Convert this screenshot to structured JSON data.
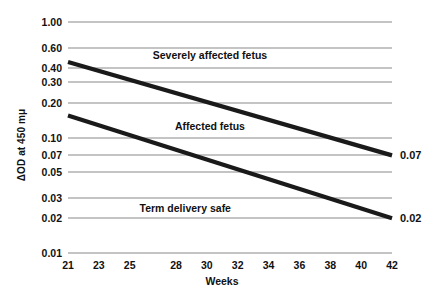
{
  "chart_data": {
    "type": "line",
    "title": "",
    "xlabel": "Weeks",
    "ylabel": "ΔOD at 450 mμ",
    "yscale": "log",
    "grid": true,
    "legend": "none",
    "xlim": [
      21,
      42
    ],
    "ylim": [
      0.01,
      1.0
    ],
    "x_ticks": [
      {
        "value": 21,
        "label": "21"
      },
      {
        "value": 23,
        "label": "23"
      },
      {
        "value": 25,
        "label": "25"
      },
      {
        "value": 28,
        "label": "28"
      },
      {
        "value": 30,
        "label": "30"
      },
      {
        "value": 32,
        "label": "32"
      },
      {
        "value": 34,
        "label": "34"
      },
      {
        "value": 36,
        "label": "36"
      },
      {
        "value": 38,
        "label": "38"
      },
      {
        "value": 40,
        "label": "40"
      },
      {
        "value": 42,
        "label": "42"
      }
    ],
    "y_ticks": [
      {
        "value": 1.0,
        "label": "1.00"
      },
      {
        "value": 0.6,
        "label": "0.60"
      },
      {
        "value": 0.4,
        "label": "0.40"
      },
      {
        "value": 0.3,
        "label": "0.30"
      },
      {
        "value": 0.2,
        "label": "0.20"
      },
      {
        "value": 0.1,
        "label": "0.10"
      },
      {
        "value": 0.07,
        "label": "0.07"
      },
      {
        "value": 0.05,
        "label": "0.05"
      },
      {
        "value": 0.03,
        "label": "0.03"
      },
      {
        "value": 0.02,
        "label": "0.02"
      },
      {
        "value": 0.01,
        "label": "0.01"
      }
    ],
    "series": [
      {
        "name": "upper-boundary",
        "x": [
          21,
          42
        ],
        "values": [
          0.45,
          0.07
        ],
        "end_label": "0.07"
      },
      {
        "name": "lower-boundary",
        "x": [
          21,
          42
        ],
        "values": [
          0.155,
          0.02
        ],
        "end_label": "0.02"
      }
    ],
    "zone_annotations": [
      {
        "text": "Severely affected fetus",
        "x": 30.2,
        "y": 0.52
      },
      {
        "text": "Affected fetus",
        "x": 30.2,
        "y": 0.125
      },
      {
        "text": "Term delivery safe",
        "x": 28.6,
        "y": 0.0245
      }
    ],
    "end_labels": [
      {
        "text": "0.07",
        "value": 0.07
      },
      {
        "text": "0.02",
        "value": 0.02
      }
    ],
    "colors": {
      "line": "#1a1a1a",
      "grid": "#8a8a8a",
      "text": "#111111",
      "background": "#ffffff"
    }
  }
}
